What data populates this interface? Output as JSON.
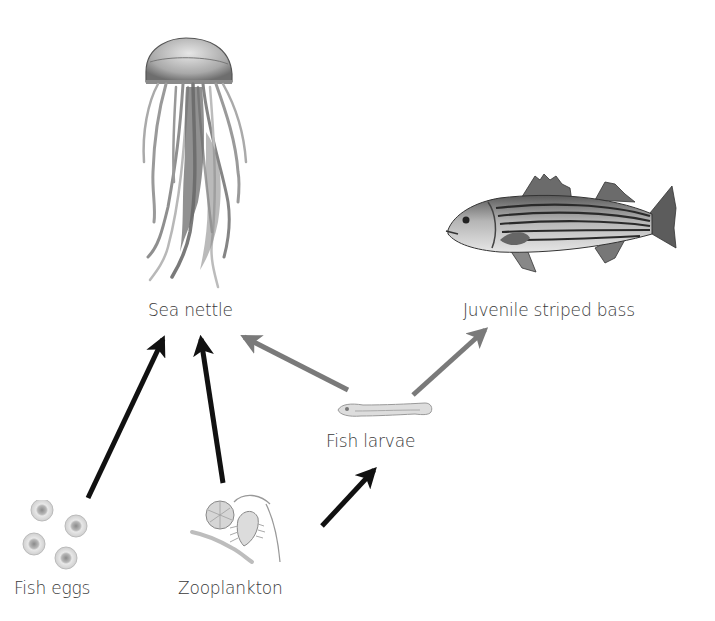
{
  "diagram": {
    "type": "food-web",
    "colors": {
      "background": "#ffffff",
      "label_text": "#3a3a3a",
      "arrow_black": "#111111",
      "arrow_gray": "#7a7a7a"
    },
    "nodes": [
      {
        "id": "sea_nettle",
        "label": "Sea nettle",
        "icon": "jellyfish-illustration"
      },
      {
        "id": "juvenile_striped_bass",
        "label": "Juvenile striped bass",
        "icon": "striped-bass-illustration"
      },
      {
        "id": "fish_larvae",
        "label": "Fish larvae",
        "icon": "fish-larva-illustration"
      },
      {
        "id": "fish_eggs",
        "label": "Fish eggs",
        "icon": "fish-eggs-illustration"
      },
      {
        "id": "zooplankton",
        "label": "Zooplankton",
        "icon": "zooplankton-illustration"
      }
    ],
    "edges": [
      {
        "from": "fish_eggs",
        "to": "sea_nettle",
        "color": "black"
      },
      {
        "from": "zooplankton",
        "to": "sea_nettle",
        "color": "black"
      },
      {
        "from": "fish_larvae",
        "to": "sea_nettle",
        "color": "gray"
      },
      {
        "from": "fish_larvae",
        "to": "juvenile_striped_bass",
        "color": "gray"
      },
      {
        "from": "zooplankton",
        "to": "fish_larvae",
        "color": "black"
      }
    ]
  }
}
